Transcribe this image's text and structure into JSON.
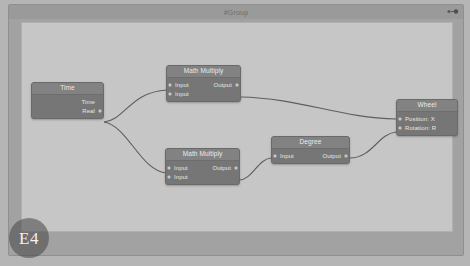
{
  "editor": {
    "canvas_color": "#c6c6c6",
    "wire_color": "#5e5e5e"
  },
  "group": {
    "title": "#Group",
    "corner_icon": "node-collapse-icon",
    "frame_color": "#a2a2a2"
  },
  "nodes": [
    {
      "id": "time",
      "title": "Time",
      "inputs": [],
      "outputs": [
        "Time",
        "Real"
      ]
    },
    {
      "id": "math-multiply-top",
      "title": "Math Multiply",
      "inputs": [
        "Input",
        "Input"
      ],
      "outputs": [
        "Output"
      ]
    },
    {
      "id": "math-multiply-bottom",
      "title": "Math Multiply",
      "inputs": [
        "Input",
        "Input"
      ],
      "outputs": [
        "Output"
      ]
    },
    {
      "id": "degree",
      "title": "Degree",
      "inputs": [
        "Input"
      ],
      "outputs": [
        "Output"
      ]
    },
    {
      "id": "wheel",
      "title": "Wheel",
      "inputs": [
        "Position: X",
        "Rotation: R"
      ],
      "outputs": []
    }
  ],
  "watermark": {
    "label": "E4"
  }
}
